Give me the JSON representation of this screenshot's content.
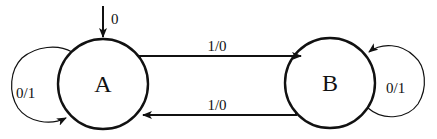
{
  "diagram": {
    "type": "finite-state-machine (Mealy)",
    "states": [
      {
        "id": "A",
        "label": "A",
        "initial": true
      },
      {
        "id": "B",
        "label": "B",
        "initial": false
      }
    ],
    "initial_arrow_label": "0",
    "transitions": [
      {
        "from": "A",
        "to": "A",
        "label": "0/1"
      },
      {
        "from": "A",
        "to": "B",
        "label": "1/0"
      },
      {
        "from": "B",
        "to": "A",
        "label": "1/0"
      },
      {
        "from": "B",
        "to": "B",
        "label": "0/1"
      }
    ],
    "colors": {
      "stroke": "#111111",
      "background": "#ffffff"
    }
  }
}
